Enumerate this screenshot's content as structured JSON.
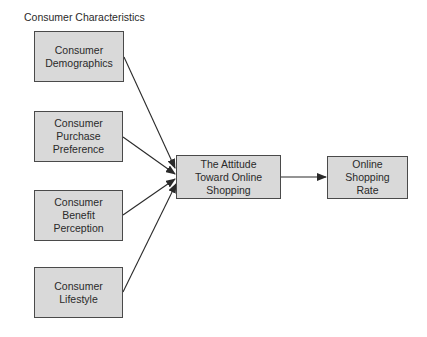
{
  "diagram": {
    "group_label": "Consumer Characteristics",
    "nodes": {
      "demographics": {
        "label": "Consumer Demographics",
        "lines": [
          "Consumer",
          "Demographics"
        ]
      },
      "purchase_preference": {
        "label": "Consumer Purchase Preference",
        "lines": [
          "Consumer",
          "Purchase",
          "Preference"
        ]
      },
      "benefit_perception": {
        "label": "Consumer Benefit Perception",
        "lines": [
          "Consumer",
          "Benefit",
          "Perception"
        ]
      },
      "lifestyle": {
        "label": "Consumer Lifestyle",
        "lines": [
          "Consumer",
          "Lifestyle"
        ]
      },
      "attitude": {
        "label": "The Attitude Toward Online Shopping",
        "lines": [
          "The Attitude",
          "Toward Online",
          "Shopping"
        ]
      },
      "shopping_rate": {
        "label": "Online Shopping Rate",
        "lines": [
          "Online",
          "Shopping",
          "Rate"
        ]
      }
    },
    "edges": [
      {
        "from": "demographics",
        "to": "attitude"
      },
      {
        "from": "purchase_preference",
        "to": "attitude"
      },
      {
        "from": "benefit_perception",
        "to": "attitude"
      },
      {
        "from": "lifestyle",
        "to": "attitude"
      },
      {
        "from": "attitude",
        "to": "shopping_rate"
      }
    ],
    "colors": {
      "node_fill": "#d9d9d9",
      "node_border": "#4a4a4a",
      "edge": "#2a2a2a"
    }
  }
}
